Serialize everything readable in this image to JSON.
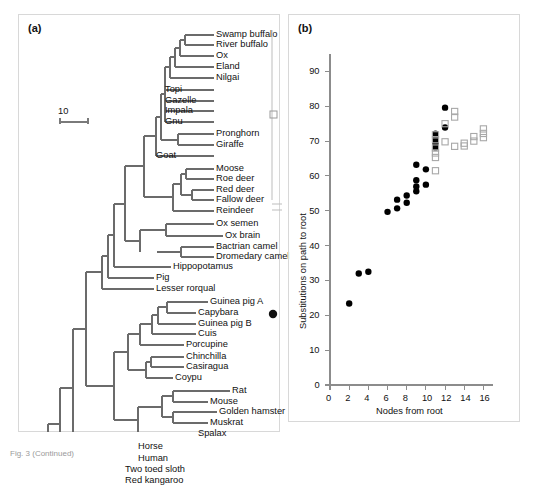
{
  "figure": {
    "caption_fragment": "Fig. 3 (Continued)",
    "panels": [
      {
        "key": "a",
        "label": "(a)"
      },
      {
        "key": "b",
        "label": "(b)"
      }
    ]
  },
  "panel_a": {
    "label": "(a)",
    "type": "phylogenetic-tree",
    "scale_bar": {
      "label": "10",
      "units": "substitutions"
    },
    "group_markers": [
      {
        "name": "artiodactyl-bracket-marker",
        "symbol": "open-square",
        "group": "Artiodactyla"
      },
      {
        "name": "rodent-bracket-marker",
        "symbol": "filled-circle",
        "group": "Rodentia"
      }
    ],
    "taxa": [
      "Swamp buffalo",
      "River buffalo",
      "Ox",
      "Eland",
      "Nilgai",
      "Topi",
      "Gazelle",
      "Impala",
      "Gnu",
      "Pronghorn",
      "Giraffe",
      "Goat",
      "Moose",
      "Roe deer",
      "Red deer",
      "Fallow deer",
      "Reindeer",
      "Ox semen",
      "Ox brain",
      "Bactrian camel",
      "Dromedary camel",
      "Hippopotamus",
      "Pig",
      "Lesser rorqual",
      "Guinea pig A",
      "Capybara",
      "Guinea pig B",
      "Cuis",
      "Porcupine",
      "Chinchilla",
      "Casiragua",
      "Coypu",
      "Rat",
      "Mouse",
      "Golden hamster",
      "Muskrat",
      "Spalax",
      "Horse",
      "Human",
      "Two toed sloth",
      "Red kangaroo"
    ]
  },
  "panel_b": {
    "label": "(b)"
  },
  "chart_data": {
    "type": "scatter",
    "title": "",
    "xlabel": "Nodes from root",
    "ylabel": "Substitutions on path to root",
    "xlim": [
      0,
      17
    ],
    "ylim": [
      0,
      95
    ],
    "xticks": [
      0,
      2,
      4,
      6,
      8,
      10,
      12,
      14,
      16
    ],
    "yticks": [
      0,
      10,
      20,
      30,
      40,
      50,
      60,
      70,
      80,
      90
    ],
    "grid": false,
    "legend_position": "none",
    "series": [
      {
        "name": "Rodentia",
        "marker": "filled-circle",
        "color": "#000000",
        "points": [
          [
            2,
            23.4
          ],
          [
            3,
            32.0
          ],
          [
            4,
            32.5
          ],
          [
            6,
            49.7
          ],
          [
            7,
            50.7
          ],
          [
            7,
            53.2
          ],
          [
            8,
            52.3
          ],
          [
            8,
            54.4
          ],
          [
            9,
            55.6
          ],
          [
            9,
            57.0
          ],
          [
            9,
            58.8
          ],
          [
            9,
            63.2
          ],
          [
            10,
            57.5
          ],
          [
            10,
            61.9
          ],
          [
            11,
            68.2
          ],
          [
            11,
            69.4
          ],
          [
            11,
            70.5
          ],
          [
            11,
            72.1
          ],
          [
            12,
            73.9
          ],
          [
            12,
            79.6
          ]
        ]
      },
      {
        "name": "Artiodactyla",
        "marker": "open-square",
        "color": "#a8a8a8",
        "points": [
          [
            11,
            61.5
          ],
          [
            11,
            65.3
          ],
          [
            11,
            66.6
          ],
          [
            11,
            68.0
          ],
          [
            11,
            70.4
          ],
          [
            11,
            71.8
          ],
          [
            12,
            69.8
          ],
          [
            12,
            75.0
          ],
          [
            13,
            68.5
          ],
          [
            13,
            76.9
          ],
          [
            13,
            78.5
          ],
          [
            14,
            68.6
          ],
          [
            14,
            69.4
          ],
          [
            15,
            70.0
          ],
          [
            15,
            71.3
          ],
          [
            16,
            71.0
          ],
          [
            16,
            72.2
          ],
          [
            16,
            73.5
          ]
        ]
      }
    ]
  }
}
